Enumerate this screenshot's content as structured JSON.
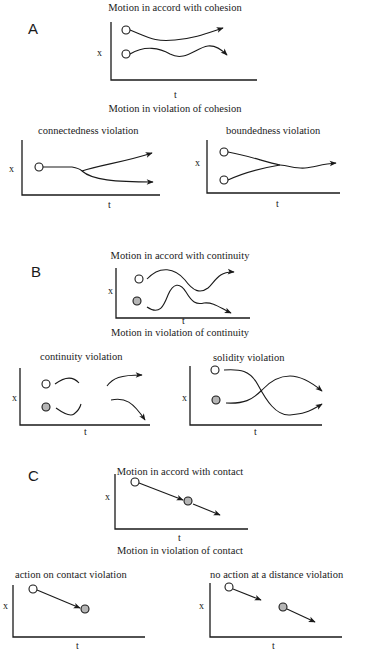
{
  "colors": {
    "ink": "#1a1a1a",
    "background": "#ffffff",
    "object_white": "#ffffff",
    "object_grey": "#b5b5b5"
  },
  "axis_labels": {
    "y": "x",
    "x": "t"
  },
  "panels": {
    "A": {
      "letter": "A",
      "accord_title": "Motion in accord with cohesion",
      "violation_title": "Motion in violation of cohesion",
      "violations": [
        {
          "label": "connectedness violation"
        },
        {
          "label": "boundedness violation"
        }
      ]
    },
    "B": {
      "letter": "B",
      "accord_title": "Motion in accord with continuity",
      "violation_title": "Motion in violation of continuity",
      "violations": [
        {
          "label": "continuity violation"
        },
        {
          "label": "solidity violation"
        }
      ]
    },
    "C": {
      "letter": "C",
      "accord_title": "Motion in accord with contact",
      "violation_title": "Motion in violation of contact",
      "violations": [
        {
          "label": "action on contact violation"
        },
        {
          "label": "no action at a distance violation"
        }
      ]
    }
  }
}
